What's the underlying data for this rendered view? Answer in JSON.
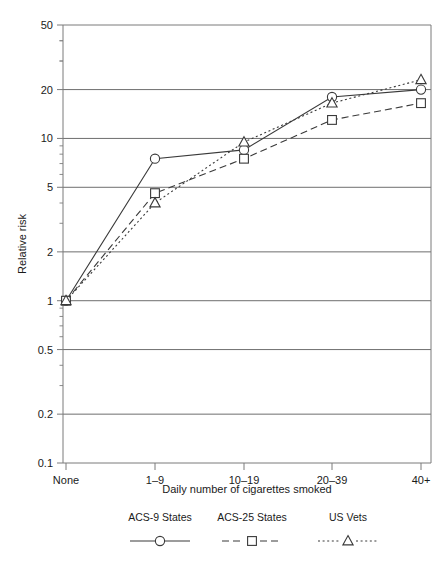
{
  "chart_data": {
    "type": "line",
    "title": "",
    "xlabel": "Daily number of cigarettes smoked",
    "ylabel": "Relative risk",
    "yscale": "log",
    "ylim": [
      0.1,
      50
    ],
    "grid": true,
    "legend_position": "bottom",
    "categories": [
      "None",
      "1–9",
      "10–19",
      "20–39",
      "40+"
    ],
    "ytick_labels": [
      "50",
      "20",
      "10",
      "5",
      "2",
      "1",
      "0.5",
      "0.2",
      "0.1"
    ],
    "ytick_values": [
      50,
      20,
      10,
      5,
      2,
      1,
      0.5,
      0.2,
      0.1
    ],
    "series": [
      {
        "name": "ACS-9 States",
        "marker": "circle",
        "linestyle": "solid",
        "values": [
          1.0,
          7.5,
          8.5,
          18.0,
          20.0
        ]
      },
      {
        "name": "ACS-25 States",
        "marker": "square",
        "linestyle": "dashed",
        "values": [
          1.0,
          4.6,
          7.5,
          13.0,
          16.5
        ]
      },
      {
        "name": "US Vets",
        "marker": "triangle",
        "linestyle": "dotted",
        "values": [
          1.0,
          4.0,
          9.5,
          16.5,
          23.0
        ]
      }
    ]
  },
  "legend": {
    "items": [
      {
        "label": "ACS-9 States",
        "marker": "circle-marker",
        "linestyle": "solid"
      },
      {
        "label": "ACS-25 States",
        "marker": "square-marker",
        "linestyle": "dashed"
      },
      {
        "label": "US Vets",
        "marker": "triangle-marker",
        "linestyle": "dotted"
      }
    ]
  },
  "colors": {
    "line": "#3a3a3a",
    "grid": "#6e6e6e",
    "frame": "#7a7a7a",
    "text": "#1a1a1a",
    "background": "#ffffff"
  }
}
